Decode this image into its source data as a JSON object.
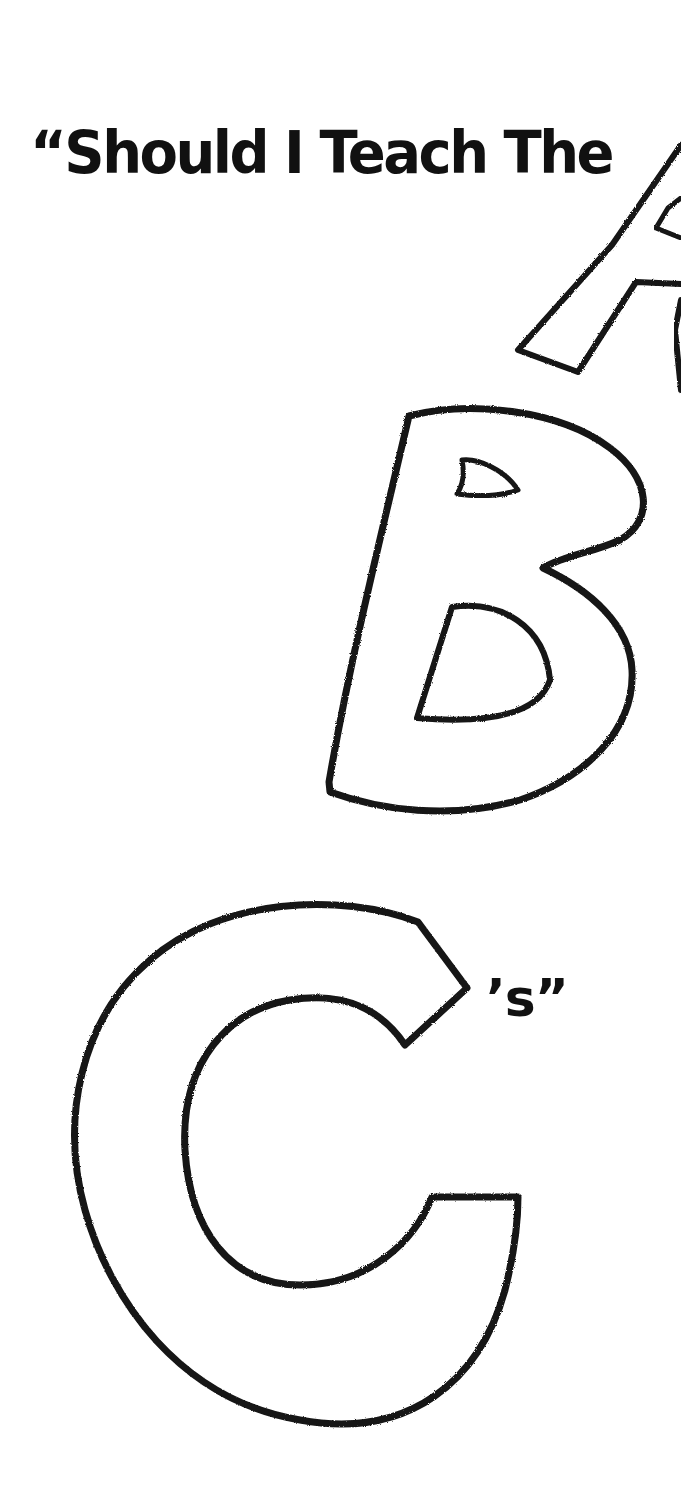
{
  "poster": {
    "title": "“Should I Teach The",
    "letters": [
      {
        "char": "A",
        "style": "hand-drawn crayon outline, partially cropped at right edge"
      },
      {
        "char": "B",
        "style": "hand-drawn crayon outline"
      },
      {
        "char": "C",
        "style": "hand-drawn crayon outline"
      }
    ],
    "suffix": "’s”",
    "colors": {
      "background": "#ffffff",
      "ink": "#111111"
    }
  }
}
